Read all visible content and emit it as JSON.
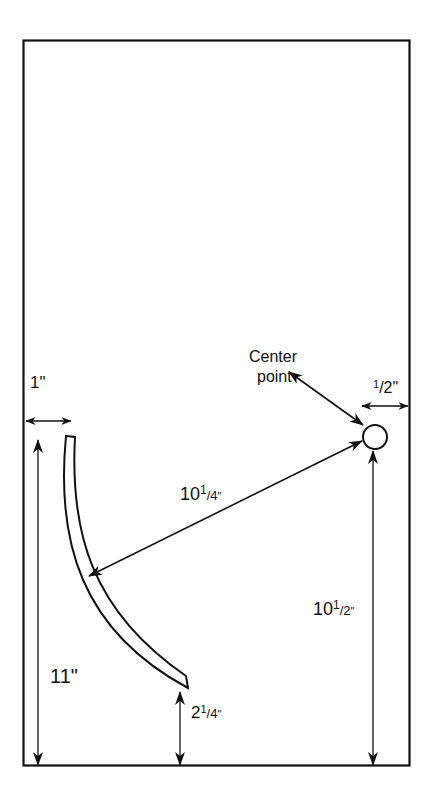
{
  "diagram": {
    "type": "dimensioned layout drawing",
    "colors": {
      "stroke": "#111111",
      "background": "#ffffff"
    },
    "labels": {
      "left_margin": {
        "whole": "1",
        "frac": "",
        "unit": "\""
      },
      "center_point": {
        "line1": "Center",
        "line2": "point"
      },
      "right_margin": {
        "whole": "",
        "num": "1",
        "den": "/2",
        "unit": "\""
      },
      "radius": {
        "whole": "10",
        "num": "1",
        "den": "/4",
        "unit": "\""
      },
      "height_center": {
        "whole": "10",
        "num": "1",
        "den": "/2",
        "unit": "\""
      },
      "left_height": {
        "whole": "11",
        "unit": "\""
      },
      "arc_bottom_clearance": {
        "whole": "2",
        "num": "1",
        "den": "/4",
        "unit": "\""
      }
    },
    "elements": [
      "board-outline",
      "curved-arc-strip",
      "center-point-circle",
      "dimension-arrows"
    ]
  }
}
